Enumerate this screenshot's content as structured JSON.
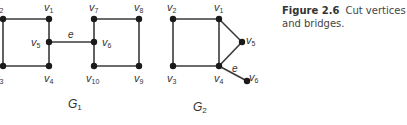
{
  "caption": {
    "figure_label": "Figure 2.6",
    "text": "Cut vertices and bridges."
  },
  "graphs": [
    {
      "name": "G",
      "subscript": "1",
      "label_pos": [
        68,
        98
      ],
      "nodes": [
        {
          "id": "v2",
          "name": "v",
          "sub": "2",
          "x": 3,
          "y": 19,
          "lx": -6,
          "ly": 2
        },
        {
          "id": "v1",
          "name": "v",
          "sub": "1",
          "x": 49,
          "y": 19,
          "lx": 44,
          "ly": 2
        },
        {
          "id": "v5",
          "name": "v",
          "sub": "5",
          "x": 49,
          "y": 42,
          "lx": 31,
          "ly": 37
        },
        {
          "id": "v3",
          "name": "v",
          "sub": "3",
          "x": 3,
          "y": 66,
          "lx": -6,
          "ly": 73
        },
        {
          "id": "v4",
          "name": "v",
          "sub": "4",
          "x": 49,
          "y": 66,
          "lx": 44,
          "ly": 73
        },
        {
          "id": "v7",
          "name": "v",
          "sub": "7",
          "x": 94,
          "y": 19,
          "lx": 89,
          "ly": 2
        },
        {
          "id": "v8",
          "name": "v",
          "sub": "8",
          "x": 139,
          "y": 19,
          "lx": 134,
          "ly": 2
        },
        {
          "id": "v6",
          "name": "v",
          "sub": "6",
          "x": 94,
          "y": 42,
          "lx": 102,
          "ly": 37
        },
        {
          "id": "v10",
          "name": "v",
          "sub": "10",
          "x": 94,
          "y": 66,
          "lx": 86,
          "ly": 73
        },
        {
          "id": "v9",
          "name": "v",
          "sub": "9",
          "x": 139,
          "y": 66,
          "lx": 134,
          "ly": 73
        }
      ],
      "edges": [
        [
          "v2",
          "v1"
        ],
        [
          "v2",
          "v3"
        ],
        [
          "v3",
          "v4"
        ],
        [
          "v1",
          "v5"
        ],
        [
          "v5",
          "v4"
        ],
        [
          "v5",
          "v6"
        ],
        [
          "v7",
          "v8"
        ],
        [
          "v7",
          "v6"
        ],
        [
          "v6",
          "v10"
        ],
        [
          "v10",
          "v9"
        ],
        [
          "v8",
          "v9"
        ]
      ],
      "bridge_label": {
        "text": "e",
        "x": 68,
        "y": 30
      }
    },
    {
      "name": "G",
      "subscript": "2",
      "label_pos": [
        193,
        101
      ],
      "nodes": [
        {
          "id": "v2",
          "name": "v",
          "sub": "2",
          "x": 173,
          "y": 19,
          "lx": 167,
          "ly": 2
        },
        {
          "id": "v1",
          "name": "v",
          "sub": "1",
          "x": 219,
          "y": 19,
          "lx": 214,
          "ly": 2
        },
        {
          "id": "v5",
          "name": "v",
          "sub": "5",
          "x": 242,
          "y": 42,
          "lx": 246,
          "ly": 35
        },
        {
          "id": "v3",
          "name": "v",
          "sub": "3",
          "x": 173,
          "y": 66,
          "lx": 167,
          "ly": 73
        },
        {
          "id": "v4",
          "name": "v",
          "sub": "4",
          "x": 219,
          "y": 66,
          "lx": 214,
          "ly": 73
        },
        {
          "id": "v6",
          "name": "v",
          "sub": "6",
          "x": 247,
          "y": 81,
          "lx": 249,
          "ly": 72
        }
      ],
      "edges": [
        [
          "v2",
          "v1"
        ],
        [
          "v2",
          "v3"
        ],
        [
          "v3",
          "v4"
        ],
        [
          "v1",
          "v4"
        ],
        [
          "v1",
          "v5"
        ],
        [
          "v5",
          "v4"
        ],
        [
          "v4",
          "v6"
        ]
      ],
      "bridge_label": {
        "text": "e",
        "x": 232,
        "y": 64
      }
    }
  ]
}
